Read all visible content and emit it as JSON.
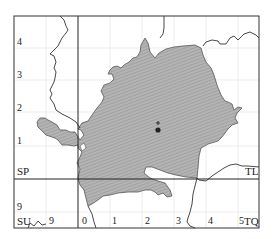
{
  "map": {
    "grid_squares": [
      "SP",
      "TL",
      "SU",
      "TQ"
    ],
    "y_axis_labels": [
      "4",
      "3",
      "2",
      "1",
      "9"
    ],
    "x_axis_labels": [
      "9",
      "0",
      "1",
      "2",
      "3",
      "4",
      "5"
    ],
    "marker": {
      "symbol": "+",
      "dot": "●"
    },
    "colors": {
      "region_fill": "#a9a9a9",
      "border": "#333333",
      "grid_faint": "#e6e6e6",
      "boundary_line": "#444444"
    }
  }
}
